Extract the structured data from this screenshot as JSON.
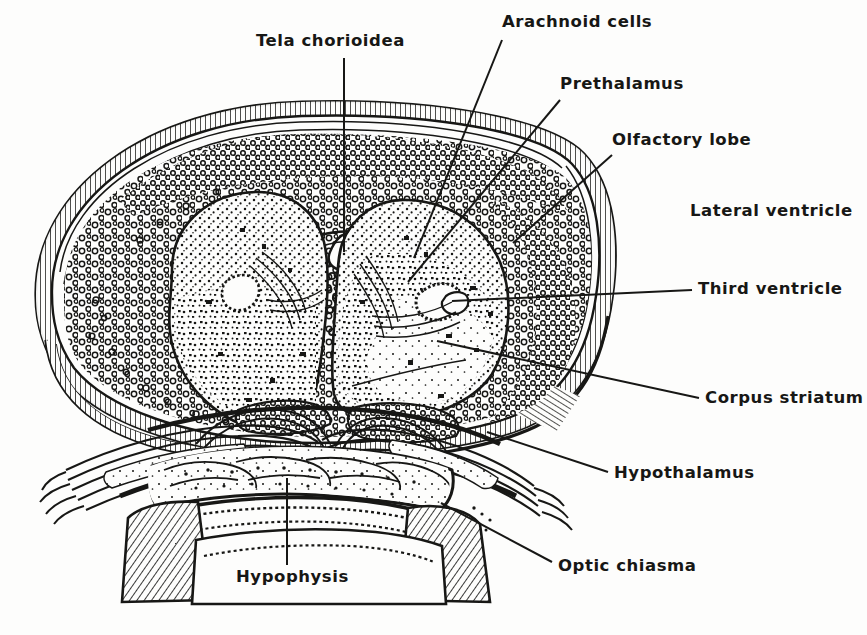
{
  "figure": {
    "kind": "anatomical-illustration",
    "style": "pen-and-ink stipple and line histological drawing",
    "ink_color": "#171715",
    "paper_color": "#fdfdfc",
    "width": 867,
    "height": 635
  },
  "labels": [
    {
      "id": "tela-chorioidea",
      "text": "Tela chorioidea",
      "x": 256,
      "y": 33,
      "anchor": "start",
      "leader": {
        "kind": "straight",
        "from": [
          344,
          58
        ],
        "to": [
          344,
          252
        ]
      }
    },
    {
      "id": "arachnoid-cells",
      "text": "Arachnoid cells",
      "x": 502,
      "y": 14,
      "anchor": "start",
      "leader": {
        "kind": "straight",
        "from": [
          502,
          40
        ],
        "to": [
          414,
          258
        ]
      }
    },
    {
      "id": "prethalamus",
      "text": "Prethalamus",
      "x": 560,
      "y": 76,
      "anchor": "start",
      "leader": {
        "kind": "straight",
        "from": [
          560,
          100
        ],
        "to": [
          408,
          282
        ]
      }
    },
    {
      "id": "olfactory-lobe",
      "text": "Olfactory lobe",
      "x": 612,
      "y": 132,
      "anchor": "start",
      "leader": {
        "kind": "straight",
        "from": [
          612,
          155
        ],
        "to": [
          513,
          243
        ]
      }
    },
    {
      "id": "lateral-ventricle",
      "text": "Lateral ventricle",
      "x": 690,
      "y": 203,
      "anchor": "start",
      "leader": null
    },
    {
      "id": "third-ventricle",
      "text": "Third ventricle",
      "x": 698,
      "y": 281,
      "anchor": "start",
      "leader": {
        "kind": "straight",
        "from": [
          692,
          290
        ],
        "to": [
          452,
          301
        ]
      }
    },
    {
      "id": "corpus-striatum",
      "text": "Corpus striatum",
      "x": 705,
      "y": 390,
      "anchor": "start",
      "leader": {
        "kind": "straight",
        "from": [
          699,
          398
        ],
        "to": [
          437,
          341
        ]
      }
    },
    {
      "id": "hypothalamus",
      "text": "Hypothalamus",
      "x": 614,
      "y": 465,
      "anchor": "start",
      "leader": {
        "kind": "straight",
        "from": [
          608,
          472
        ],
        "to": [
          487,
          432
        ]
      }
    },
    {
      "id": "optic-chiasma",
      "text": "Optic chiasma",
      "x": 558,
      "y": 558,
      "anchor": "start",
      "leader": {
        "kind": "straight",
        "from": [
          552,
          562
        ],
        "to": [
          441,
          503
        ]
      }
    },
    {
      "id": "hypophysis",
      "text": "Hypophysis",
      "x": 236,
      "y": 569,
      "anchor": "start",
      "leader": {
        "kind": "straight",
        "from": [
          287,
          565
        ],
        "to": [
          287,
          478
        ]
      }
    }
  ],
  "structures": [
    {
      "id": "dura-meninges",
      "name": "dura and meningeal sheath",
      "render": "hatched outer rind"
    },
    {
      "id": "arachnoid-layer",
      "name": "arachnoid cell layer",
      "render": "ring of small open circles"
    },
    {
      "id": "left-hemisphere",
      "name": "left cerebral hemisphere",
      "render": "stippled lobe"
    },
    {
      "id": "right-hemisphere",
      "name": "right cerebral hemisphere",
      "render": "stippled lobe"
    },
    {
      "id": "left-lateral-ventricle",
      "name": "left lateral ventricle",
      "render": "small beaded cavity"
    },
    {
      "id": "right-lateral-ventricle",
      "name": "right lateral ventricle",
      "render": "small beaded cavity"
    },
    {
      "id": "third-ventricle-cavity",
      "name": "third ventricle",
      "render": "midline cleft"
    },
    {
      "id": "optic-chiasma-body",
      "name": "optic chiasma",
      "render": "interwoven fibre bundles"
    },
    {
      "id": "hypophysis-body",
      "name": "hypophysis",
      "render": "stippled glandular band"
    },
    {
      "id": "cartilage-left",
      "name": "left cartilage block",
      "render": "diagonal hatching"
    },
    {
      "id": "cartilage-right",
      "name": "right cartilage block",
      "render": "diagonal hatching"
    }
  ]
}
